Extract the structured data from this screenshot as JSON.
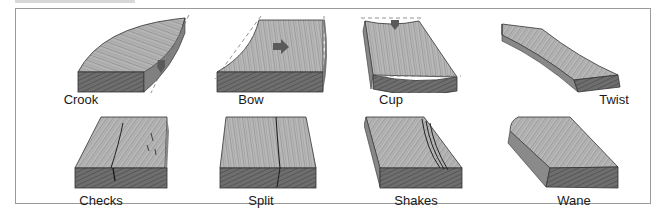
{
  "figure": {
    "caption_fragment": "",
    "colors": {
      "border": "#9a9a9a",
      "wood_face": "#b5b5b5",
      "wood_end": "#6e6e6e",
      "grain": "#555555",
      "arrow": "#5a5a5a",
      "guide_dash": "#777777"
    },
    "defects": [
      {
        "label": "Crook",
        "icon": "crook-board-icon"
      },
      {
        "label": "Bow",
        "icon": "bow-board-icon"
      },
      {
        "label": "Cup",
        "icon": "cup-board-icon"
      },
      {
        "label": "Twist",
        "icon": "twist-board-icon"
      },
      {
        "label": "Checks",
        "icon": "checks-board-icon"
      },
      {
        "label": "Split",
        "icon": "split-board-icon"
      },
      {
        "label": "Shakes",
        "icon": "shakes-board-icon"
      },
      {
        "label": "Wane",
        "icon": "wane-board-icon"
      }
    ]
  }
}
